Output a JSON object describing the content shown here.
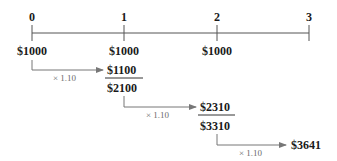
{
  "timeline": {
    "periods": [
      "0",
      "1",
      "2",
      "3"
    ],
    "deposits": [
      "$1000",
      "$1000",
      "$1000"
    ]
  },
  "steps": [
    {
      "multiplier": "× 1.10",
      "grown_value": "$1100",
      "running_total": "$2100"
    },
    {
      "multiplier": "× 1.10",
      "grown_value": "$2310",
      "running_total": "$3310"
    },
    {
      "multiplier": "× 1.10",
      "grown_value": "$3641"
    }
  ],
  "colors": {
    "text": "#1a1a1a",
    "line": "#555555",
    "arrow": "#777777",
    "multiplier_text": "#6b6b6b"
  }
}
